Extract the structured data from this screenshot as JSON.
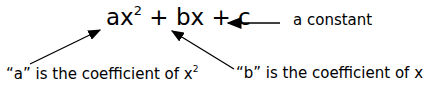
{
  "expression": {
    "a_term": "ax",
    "a_exp": "2",
    "plus1": " + ",
    "b_term": "bx",
    "plus2": " + ",
    "c_term": "c"
  },
  "labels": {
    "constant": "a constant",
    "a_coeff": "“a” is the coefficient of x",
    "a_coeff_exp": "2",
    "b_coeff": "“b” is the coefficient of x"
  }
}
